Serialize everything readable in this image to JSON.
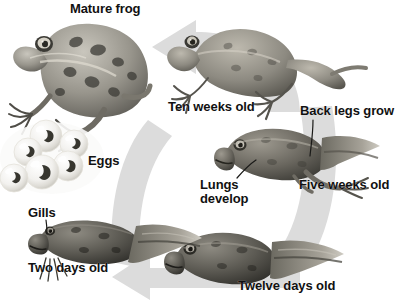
{
  "diagram": {
    "type": "life-cycle-diagram",
    "background_color": "#ffffff",
    "arrow_ring_color": "#dcdcdc",
    "text_color": "#111111",
    "direction": "counter-clockwise"
  },
  "labels": {
    "mature_frog": "Mature frog",
    "ten_weeks_old": "Ten weeks old",
    "back_legs_grow": "Back legs grow",
    "eggs": "Eggs",
    "lungs_develop": "Lungs\ndevelop",
    "five_weeks_old": "Five weeks old",
    "gills": "Gills",
    "two_days_old": "Two days old",
    "twelve_days_old": "Twelve days old"
  },
  "stages": [
    {
      "id": "mature-frog",
      "label": "Mature frog",
      "subject": "adult-frog"
    },
    {
      "id": "eggs",
      "label": "Eggs",
      "subject": "frog-egg-cluster"
    },
    {
      "id": "two-days",
      "label": "Two days old",
      "subject": "tadpole-with-gills"
    },
    {
      "id": "twelve-days",
      "label": "Twelve days old",
      "subject": "tadpole"
    },
    {
      "id": "five-weeks",
      "label": "Five weeks old",
      "subject": "tadpole-with-back-legs"
    },
    {
      "id": "ten-weeks",
      "label": "Ten weeks old",
      "subject": "young-frog"
    }
  ],
  "callouts": [
    {
      "id": "gills",
      "label": "Gills",
      "points_to": "tadpole-gills"
    },
    {
      "id": "lungs-develop",
      "label": "Lungs\ndevelop",
      "points_to": "tadpole-lungs"
    },
    {
      "id": "back-legs-grow",
      "label": "Back legs grow",
      "points_to": "tadpole-back-legs"
    }
  ]
}
